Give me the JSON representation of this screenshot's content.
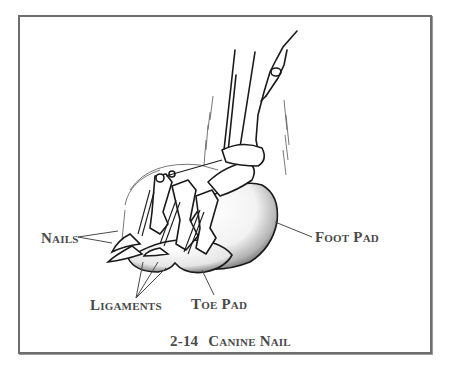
{
  "figure": {
    "number": "2-14",
    "title": "Canine Nail",
    "caption_full": "2-14 Canine Nail",
    "frame_color": "#6e6e6e",
    "ink_color": "#1a1a1a",
    "label_color": "#4a4a4a"
  },
  "labels": {
    "nails": "Nails",
    "foot_pad": "Foot Pad",
    "ligaments": "Ligaments",
    "toe_pad": "Toe Pad"
  },
  "illustration": {
    "subject": "canine paw side view with bones, nails, ligaments and pads",
    "parts": [
      "leg",
      "digit bones",
      "nails",
      "ligaments",
      "toe pad",
      "foot pad",
      "fur"
    ]
  }
}
